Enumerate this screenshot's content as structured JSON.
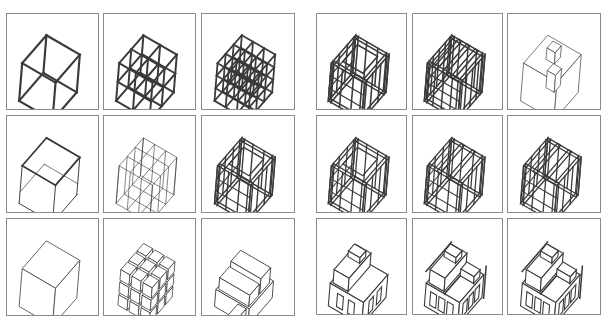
{
  "figure": {
    "groups": [
      {
        "name": "left-group",
        "panels": [
          {
            "row": 0,
            "col": 0,
            "x": 6,
            "y": 13,
            "w": 93,
            "h": 97,
            "kind": "wire-cube",
            "divisions": 1,
            "stroke": 2.2
          },
          {
            "row": 0,
            "col": 1,
            "x": 103,
            "y": 13,
            "w": 93,
            "h": 97,
            "kind": "wire-cube",
            "divisions": 2,
            "stroke": 2.0
          },
          {
            "row": 0,
            "col": 2,
            "x": 201,
            "y": 13,
            "w": 94,
            "h": 97,
            "kind": "wire-cube",
            "divisions": 3,
            "stroke": 1.8
          },
          {
            "row": 1,
            "col": 0,
            "x": 6,
            "y": 115,
            "w": 93,
            "h": 98,
            "kind": "open-box",
            "divisions": 1,
            "stroke": 1.0
          },
          {
            "row": 1,
            "col": 1,
            "x": 103,
            "y": 115,
            "w": 93,
            "h": 98,
            "kind": "slab-cube",
            "divisions": 3,
            "stroke": 0.8
          },
          {
            "row": 1,
            "col": 2,
            "x": 201,
            "y": 115,
            "w": 94,
            "h": 98,
            "kind": "frame-layers",
            "divisions": 3,
            "stroke": 1.4
          },
          {
            "row": 2,
            "col": 0,
            "x": 6,
            "y": 218,
            "w": 93,
            "h": 98,
            "kind": "solid-cube",
            "divisions": 1,
            "stroke": 0.8
          },
          {
            "row": 2,
            "col": 1,
            "x": 103,
            "y": 218,
            "w": 93,
            "h": 98,
            "kind": "block-cube",
            "divisions": 3,
            "stroke": 0.8
          },
          {
            "row": 2,
            "col": 2,
            "x": 201,
            "y": 218,
            "w": 94,
            "h": 98,
            "kind": "massing",
            "divisions": 2,
            "stroke": 0.9
          }
        ]
      },
      {
        "name": "right-group",
        "panels": [
          {
            "row": 0,
            "col": 0,
            "x": 316,
            "y": 13,
            "w": 91,
            "h": 97,
            "kind": "frame-layers",
            "divisions": 3,
            "stroke": 1.6
          },
          {
            "row": 0,
            "col": 1,
            "x": 412,
            "y": 13,
            "w": 91,
            "h": 97,
            "kind": "frame-stripes",
            "divisions": 4,
            "stroke": 1.5
          },
          {
            "row": 0,
            "col": 2,
            "x": 507,
            "y": 13,
            "w": 94,
            "h": 97,
            "kind": "box-with-voids",
            "divisions": 1,
            "stroke": 0.7
          },
          {
            "row": 1,
            "col": 0,
            "x": 316,
            "y": 115,
            "w": 91,
            "h": 98,
            "kind": "frame-layers",
            "divisions": 3,
            "stroke": 1.3
          },
          {
            "row": 1,
            "col": 1,
            "x": 412,
            "y": 115,
            "w": 91,
            "h": 98,
            "kind": "frame-stripes",
            "divisions": 3,
            "stroke": 1.3
          },
          {
            "row": 1,
            "col": 2,
            "x": 507,
            "y": 115,
            "w": 94,
            "h": 98,
            "kind": "frame-stripes",
            "divisions": 3,
            "stroke": 1.3
          },
          {
            "row": 2,
            "col": 0,
            "x": 316,
            "y": 218,
            "w": 91,
            "h": 97,
            "kind": "house",
            "divisions": 2,
            "stroke": 1.1
          },
          {
            "row": 2,
            "col": 1,
            "x": 412,
            "y": 218,
            "w": 91,
            "h": 97,
            "kind": "house-detailed",
            "divisions": 3,
            "stroke": 1.1
          },
          {
            "row": 2,
            "col": 2,
            "x": 507,
            "y": 218,
            "w": 94,
            "h": 97,
            "kind": "house-detailed",
            "divisions": 3,
            "stroke": 1.1
          }
        ]
      }
    ],
    "colors": {
      "line": "#3a3a3a",
      "border": "#8a8a8a",
      "background": "#ffffff"
    }
  }
}
